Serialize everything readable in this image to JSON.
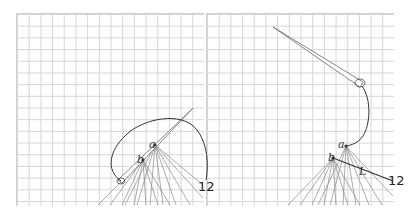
{
  "panels": [
    {
      "id": "left",
      "labels": {
        "a": "a",
        "b": "b",
        "twelve": "12"
      }
    },
    {
      "id": "right",
      "labels": {
        "a": "a",
        "b": "b",
        "l": "L",
        "twelve": "12"
      }
    }
  ],
  "colors": {
    "grid": "#d6d6d6",
    "thread": "#333333",
    "rays": "#777777",
    "background": "#ffffff"
  }
}
